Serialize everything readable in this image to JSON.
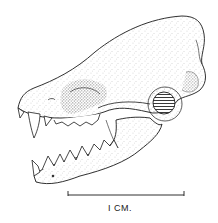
{
  "figure": {
    "style": "stipple-ink-illustration",
    "colors": {
      "ink": "#1a1a1a",
      "background": "#ffffff",
      "stipple": "#555555"
    }
  },
  "scale_bar": {
    "label": "I CM.",
    "length_px": 116
  }
}
